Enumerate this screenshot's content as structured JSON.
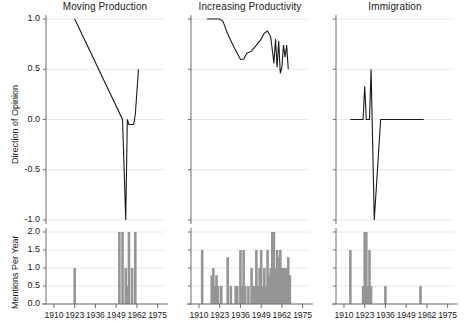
{
  "figure": {
    "width": 466,
    "height": 334,
    "background": "#ffffff",
    "line_color": "#1a1a1a",
    "bar_color": "#959595",
    "grid_color": "#e8e8e8",
    "axis_color": "#6e6e6e"
  },
  "axes": {
    "top_ylabel": "Direction of Opinion",
    "bottom_ylabel": "Mentions Per Year",
    "top_yticks": [
      "1.0",
      "0.5",
      "0.0",
      "-0.5",
      "-1.0"
    ],
    "top_ytick_values": [
      1.0,
      0.5,
      0.0,
      -0.5,
      -1.0
    ],
    "bottom_yticks": [
      "2.0",
      "1.5",
      "1.0",
      "0.5",
      "0.0"
    ],
    "bottom_ytick_values": [
      2.0,
      1.5,
      1.0,
      0.5,
      0.0
    ],
    "xticks": [
      "1910",
      "1923",
      "1936",
      "1949",
      "1962",
      "1975"
    ],
    "xtick_values": [
      1910,
      1923,
      1936,
      1949,
      1962,
      1975
    ],
    "xlim": [
      1905,
      1979
    ],
    "top_ylim": [
      -1.0,
      1.0
    ],
    "bottom_ylim": [
      0.0,
      2.0
    ]
  },
  "chart_data": {
    "type": "line",
    "title": "",
    "xlabel": "",
    "ylabel": "Direction of Opinion",
    "xlim": [
      1905,
      1979
    ],
    "ylim": [
      -1.0,
      1.0
    ],
    "grid": true,
    "legend": "none",
    "panels": [
      {
        "title": "Moving Production",
        "opinion": {
          "type": "line",
          "ylabel": "Direction of Opinion",
          "ylim": [
            -1.0,
            1.0
          ],
          "x": [
            1923,
            1953,
            1955,
            1956,
            1957,
            1960,
            1961,
            1963
          ],
          "y": [
            1.0,
            0.0,
            -1.0,
            0.0,
            -0.05,
            -0.05,
            0.05,
            0.5
          ]
        },
        "mentions": {
          "type": "bar",
          "ylabel": "Mentions Per Year",
          "ylim": [
            0.0,
            2.0
          ],
          "x": [
            1923,
            1951,
            1953,
            1955,
            1956,
            1957,
            1959,
            1961
          ],
          "values": [
            1.0,
            2.0,
            2.0,
            1.0,
            0.5,
            2.0,
            1.0,
            2.0
          ]
        }
      },
      {
        "title": "Increasing Productivity",
        "opinion": {
          "type": "line",
          "ylabel": "Direction of Opinion",
          "ylim": [
            -1.0,
            1.0
          ],
          "x": [
            1915,
            1919,
            1923,
            1925,
            1928,
            1932,
            1936,
            1938,
            1940,
            1943,
            1946,
            1949,
            1951,
            1953,
            1955,
            1957,
            1958,
            1959,
            1960,
            1961,
            1962,
            1963,
            1964,
            1965,
            1966
          ],
          "y": [
            1.0,
            1.0,
            1.0,
            0.98,
            0.85,
            0.72,
            0.6,
            0.6,
            0.66,
            0.68,
            0.74,
            0.8,
            0.86,
            0.88,
            0.82,
            0.56,
            0.8,
            0.52,
            0.78,
            0.46,
            0.52,
            0.74,
            0.62,
            0.74,
            0.5
          ]
        },
        "mentions": {
          "type": "bar",
          "ylabel": "Mentions Per Year",
          "ylim": [
            0.0,
            2.0
          ],
          "x": [
            1912,
            1918,
            1919,
            1920,
            1921,
            1922,
            1924,
            1925,
            1928,
            1930,
            1931,
            1933,
            1934,
            1935,
            1936,
            1937,
            1938,
            1939,
            1941,
            1943,
            1944,
            1945,
            1946,
            1947,
            1948,
            1949,
            1950,
            1951,
            1952,
            1953,
            1954,
            1955,
            1956,
            1957,
            1958,
            1959,
            1960,
            1961,
            1962,
            1963,
            1964,
            1965,
            1966,
            1967
          ],
          "values": [
            1.5,
            0.8,
            1.0,
            0.5,
            0.8,
            0.5,
            0.5,
            0.0,
            1.3,
            0.5,
            0.0,
            0.5,
            0.5,
            0.0,
            1.5,
            0.5,
            1.5,
            0.5,
            0.5,
            1.0,
            0.5,
            0.5,
            1.5,
            0.5,
            1.0,
            1.5,
            0.5,
            1.0,
            0.5,
            1.5,
            0.8,
            1.0,
            2.0,
            2.0,
            1.0,
            1.5,
            1.3,
            1.5,
            1.0,
            1.0,
            1.0,
            1.0,
            1.3,
            0.8
          ]
        }
      },
      {
        "title": "Immigration",
        "opinion": {
          "type": "line",
          "ylabel": "Direction of Opinion",
          "ylim": [
            -1.0,
            1.0
          ],
          "x": [
            1914,
            1922,
            1923,
            1924,
            1926,
            1927,
            1929,
            1933,
            1934,
            1960
          ],
          "y": [
            0.0,
            0.0,
            0.33,
            0.0,
            0.0,
            0.5,
            -1.0,
            0.0,
            0.0,
            0.0
          ]
        },
        "mentions": {
          "type": "bar",
          "ylabel": "Mentions Per Year",
          "ylim": [
            0.0,
            2.0
          ],
          "x": [
            1914,
            1922,
            1923,
            1924,
            1925,
            1926,
            1927,
            1936,
            1958
          ],
          "values": [
            1.5,
            0.5,
            2.0,
            2.0,
            0.5,
            1.5,
            0.5,
            0.5,
            0.5
          ]
        }
      }
    ]
  }
}
